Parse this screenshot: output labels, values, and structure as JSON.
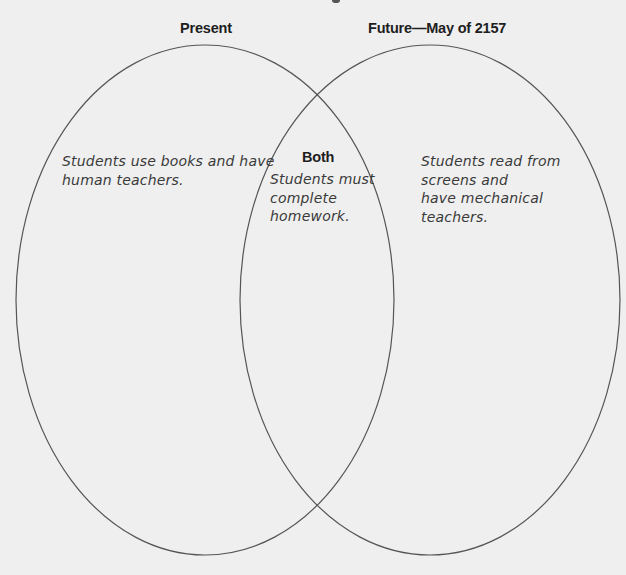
{
  "diagram": {
    "type": "venn",
    "colors": {
      "background": "#efefef",
      "outline": "#555555",
      "label_text": "#1e1e1e",
      "handwriting_text": "#3a3a3a"
    },
    "sets": {
      "left": {
        "label": "Present",
        "text_lines": [
          "Students use books and have",
          "human teachers."
        ]
      },
      "overlap": {
        "label": "Both",
        "text_lines": [
          "Students must",
          "complete",
          "homework."
        ]
      },
      "right": {
        "label": "Future—May of 2157",
        "text_lines": [
          "Students read from",
          "screens and",
          "have mechanical",
          "teachers."
        ]
      }
    }
  }
}
